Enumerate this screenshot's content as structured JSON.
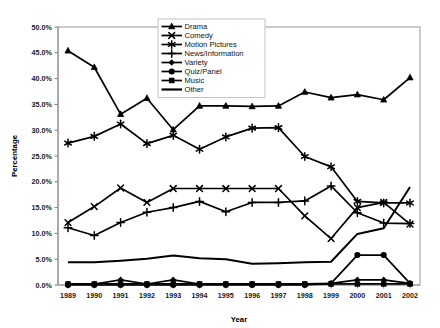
{
  "chart_data": {
    "type": "line",
    "title": "",
    "xlabel": "Year",
    "ylabel": "Percentage",
    "grid": false,
    "legend_position": "top-right",
    "categories": [
      "1989",
      "1990",
      "1991",
      "1992",
      "1993",
      "1994",
      "1995",
      "1996",
      "1997",
      "1998",
      "1999",
      "2000",
      "2001",
      "2002"
    ],
    "x": [
      1989,
      1990,
      1991,
      1992,
      1993,
      1994,
      1995,
      1996,
      1997,
      1998,
      1999,
      2000,
      2001,
      2002
    ],
    "xlim": [
      1989,
      2002
    ],
    "ylim": [
      0,
      50
    ],
    "ytick_labels": [
      "0.0%",
      "5.0%",
      "10.0%",
      "15.0%",
      "20.0%",
      "25.0%",
      "30.0%",
      "35.0%",
      "40.0%",
      "45.0%",
      "50.0%"
    ],
    "ytick_values": [
      0,
      5,
      10,
      15,
      20,
      25,
      30,
      35,
      40,
      45,
      50
    ],
    "units": "percent",
    "series": [
      {
        "name": "Drama",
        "marker": "triangle",
        "values": [
          45.4,
          42.2,
          33.1,
          36.2,
          30.1,
          34.7,
          34.7,
          34.6,
          34.7,
          37.4,
          36.3,
          36.9,
          35.9,
          40.2
        ]
      },
      {
        "name": "Comedy",
        "marker": "x-cross",
        "values": [
          12.1,
          15.2,
          18.8,
          16.0,
          18.7,
          18.7,
          18.7,
          18.7,
          18.7,
          13.4,
          9.0,
          15.0,
          16.0,
          11.8
        ]
      },
      {
        "name": "Motion Pictures",
        "marker": "asterisk",
        "values": [
          27.5,
          28.8,
          31.2,
          27.4,
          29.0,
          26.3,
          28.7,
          30.4,
          30.5,
          24.9,
          22.9,
          16.2,
          15.9,
          15.9
        ]
      },
      {
        "name": "News/Information",
        "marker": "plus",
        "values": [
          11.1,
          9.6,
          12.1,
          14.1,
          15.0,
          16.2,
          14.2,
          16.0,
          16.0,
          16.3,
          19.2,
          14.0,
          12.0,
          11.9
        ]
      },
      {
        "name": "Variety",
        "marker": "diamond",
        "values": [
          0.2,
          0.2,
          1.0,
          0.2,
          1.0,
          0.2,
          0.2,
          0.2,
          0.2,
          0.2,
          0.3,
          1.0,
          1.0,
          0.3
        ]
      },
      {
        "name": "Quiz/Panel",
        "marker": "circle",
        "values": [
          0.0,
          0.0,
          0.0,
          0.0,
          0.0,
          0.0,
          0.0,
          0.0,
          0.0,
          0.0,
          0.3,
          5.8,
          5.8,
          0.3
        ]
      },
      {
        "name": "Music",
        "marker": "square",
        "values": [
          0.2,
          0.2,
          0.2,
          0.2,
          0.2,
          0.2,
          0.2,
          0.2,
          0.2,
          0.2,
          0.2,
          0.2,
          0.2,
          0.2
        ]
      },
      {
        "name": "Other",
        "marker": "none",
        "values": [
          4.4,
          4.4,
          4.7,
          5.1,
          5.7,
          5.2,
          5.0,
          4.1,
          4.2,
          4.4,
          4.5,
          9.9,
          11.0,
          19.0
        ]
      }
    ]
  },
  "legend": {
    "items": [
      {
        "label": "Drama",
        "marker": "triangle"
      },
      {
        "label": "Comedy",
        "marker": "x-cross"
      },
      {
        "label": "Motion Pictures",
        "marker": "asterisk"
      },
      {
        "label": "News/Information",
        "marker": "plus"
      },
      {
        "label": "Variety",
        "marker": "diamond"
      },
      {
        "label": "Quiz/Panel",
        "marker": "circle"
      },
      {
        "label": "Music",
        "marker": "square"
      },
      {
        "label": "Other",
        "marker": "none"
      }
    ]
  },
  "colors": {
    "line": "#000000",
    "axis": "#808080",
    "text": "#111111",
    "background": "#ffffff"
  }
}
